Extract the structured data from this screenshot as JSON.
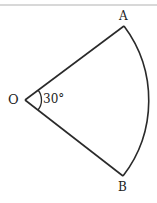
{
  "diagram": {
    "type": "circular-sector",
    "points": {
      "center": {
        "label": "O"
      },
      "a": {
        "label": "A"
      },
      "b": {
        "label": "B"
      }
    },
    "angle_label": "30°",
    "colors": {
      "stroke": "#2a2a2a",
      "background": "#ffffff",
      "top_rule": "#d8d8d8"
    }
  }
}
